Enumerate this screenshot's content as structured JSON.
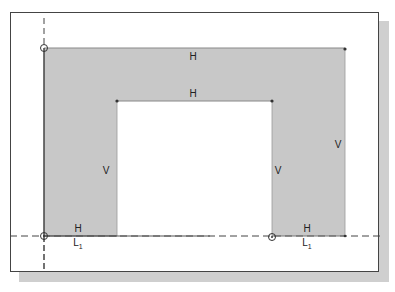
{
  "figure": {
    "fill_color": "#c8c8c8",
    "line_color": "#555555",
    "constraints": {
      "top_outer": "H",
      "top_inner": "H",
      "left_inner_vertical": "V",
      "right_inner_vertical": "V",
      "right_outer_vertical": "V",
      "bottom_left": "H",
      "bottom_right": "H",
      "bottom_left_length": "L",
      "bottom_right_length": "L",
      "length_subscript": "1"
    }
  }
}
